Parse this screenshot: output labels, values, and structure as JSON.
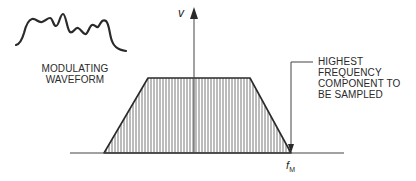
{
  "diagram": {
    "waveform_label": [
      "MODULATING",
      "WAVEFORM"
    ],
    "y_axis_label": "v",
    "x_marker_label": "f",
    "x_marker_subscript": "M",
    "annotation": [
      "HIGHEST",
      "FREQUENCY",
      "COMPONENT TO",
      "BE SAMPLED"
    ],
    "colors": {
      "line": "#2a2a2a",
      "hatch": "#555555",
      "background": "#ffffff"
    }
  }
}
